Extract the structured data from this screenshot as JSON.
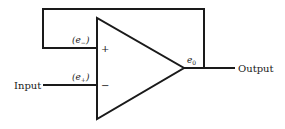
{
  "diagram": {
    "type": "op-amp circuit",
    "labels": {
      "input": "Input",
      "output": "Output",
      "e_minus": "(e",
      "e_minus_sub": "−",
      "e_minus_close": ")",
      "e_plus": "(e",
      "e_plus_sub": "+",
      "e_plus_close": ")",
      "plus_terminal": "+",
      "minus_terminal": "−",
      "e0": "e",
      "e0_sub": "0"
    },
    "colors": {
      "line": "#1a1a1a",
      "background": "#ffffff"
    }
  }
}
